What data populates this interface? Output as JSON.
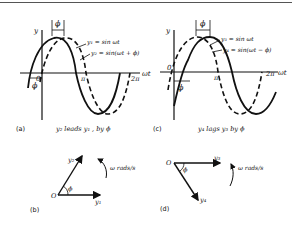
{
  "panels": {
    "a": {
      "tag": "(a)",
      "caption": "y₂  leads  y₁ , by  ϕ",
      "y_axis": "y",
      "x_axis": "ωt",
      "origin": "0",
      "pi": "π",
      "two_pi": "2π",
      "phi_top": "ϕ",
      "phi_bottom": "ϕ",
      "curve1": "y₁ = sin ωt",
      "curve2": "y₂ = sin(ωt + ϕ)"
    },
    "b": {
      "tag": "(b)",
      "origin": "O",
      "phasor_ref": "y₁",
      "phasor_rot": "y₂",
      "angle": "ϕ",
      "rotation": "ω rads/s"
    },
    "c": {
      "tag": "(c)",
      "caption": "y₄   lags  y₃  by  ϕ",
      "y_axis": "y",
      "x_axis": "ωt",
      "origin": "0",
      "pi": "π",
      "two_pi": "2π",
      "phi_top": "ϕ",
      "phi_bottom": "ϕ",
      "curve1": "y₃ = sin ωt",
      "curve2": "y₄ = sin(ωt − ϕ)"
    },
    "d": {
      "tag": "(d)",
      "origin": "O",
      "phasor_ref": "y₃",
      "phasor_rot": "y₄",
      "angle": "ϕ",
      "rotation": "ω rads/s"
    }
  }
}
